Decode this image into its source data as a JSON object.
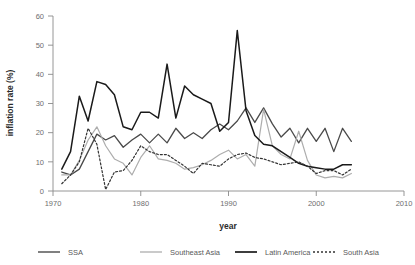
{
  "chart_data": {
    "type": "line",
    "title": "",
    "xlabel": "year",
    "ylabel": "inflation rate (%)",
    "xlim": [
      1970,
      2010
    ],
    "ylim": [
      0,
      60
    ],
    "xticks": [
      1970,
      1980,
      1990,
      2000,
      2010
    ],
    "yticks": [
      0,
      10,
      20,
      30,
      40,
      50,
      60
    ],
    "grid": false,
    "legend_position": "bottom",
    "x": [
      1971,
      1972,
      1973,
      1974,
      1975,
      1976,
      1977,
      1978,
      1979,
      1980,
      1981,
      1982,
      1983,
      1984,
      1985,
      1986,
      1987,
      1988,
      1989,
      1990,
      1991,
      1992,
      1993,
      1994,
      1995,
      1996,
      1997,
      1998,
      1999,
      2000,
      2001,
      2002,
      2003,
      2004
    ],
    "series": [
      {
        "name": "SSA",
        "color": "#4a4a4a",
        "width": 1.3,
        "dash": "none",
        "values": [
          6.5,
          5.5,
          7.5,
          13.5,
          19.5,
          17.5,
          19.0,
          15.0,
          17.5,
          19.5,
          16.5,
          19.5,
          16.5,
          21.5,
          18.0,
          20.0,
          18.0,
          21.0,
          23.0,
          21.0,
          24.0,
          28.5,
          23.5,
          28.5,
          23.0,
          18.5,
          21.5,
          16.5,
          21.5,
          17.0,
          21.5,
          13.5,
          21.5,
          17.0
        ]
      },
      {
        "name": "Southeast Asia",
        "color": "#adadad",
        "width": 1.2,
        "dash": "none",
        "values": [
          5.5,
          5.5,
          10.5,
          17.5,
          22.0,
          15.5,
          11.0,
          9.5,
          5.5,
          11.5,
          15.5,
          11.0,
          10.5,
          9.5,
          7.5,
          8.0,
          9.0,
          10.5,
          12.5,
          14.0,
          11.0,
          12.5,
          8.5,
          28.0,
          15.5,
          12.5,
          11.0,
          20.5,
          10.5,
          5.5,
          4.5,
          5.0,
          4.5,
          6.0
        ]
      },
      {
        "name": "Latin America",
        "color": "#1a1a1a",
        "width": 1.5,
        "dash": "none",
        "values": [
          7.5,
          13.5,
          32.5,
          24.0,
          37.5,
          36.5,
          33.0,
          22.0,
          21.0,
          27.0,
          27.0,
          25.0,
          43.5,
          25.0,
          36.0,
          33.0,
          31.5,
          30.0,
          20.5,
          23.5,
          55.0,
          27.5,
          19.0,
          16.0,
          15.5,
          13.5,
          11.5,
          9.5,
          8.5,
          8.0,
          7.5,
          7.5,
          9.0,
          9.0
        ]
      },
      {
        "name": "South Asia",
        "color": "#333333",
        "width": 1.2,
        "dash": "2,2",
        "values": [
          2.5,
          5.5,
          10.0,
          21.5,
          16.0,
          0.5,
          6.5,
          7.0,
          10.5,
          15.5,
          13.5,
          12.5,
          12.5,
          10.5,
          8.5,
          6.0,
          9.5,
          9.0,
          8.5,
          11.0,
          12.5,
          13.0,
          11.5,
          11.0,
          10.0,
          9.0,
          9.5,
          10.0,
          8.5,
          6.0,
          7.0,
          7.0,
          5.5,
          7.5
        ]
      }
    ],
    "legend": [
      {
        "label": "SSA",
        "color": "#4a4a4a",
        "dash": "none",
        "width": 1.4
      },
      {
        "label": "Southeast Asia",
        "color": "#adadad",
        "dash": "none",
        "width": 1.3
      },
      {
        "label": "Latin America",
        "color": "#1a1a1a",
        "dash": "none",
        "width": 1.7
      },
      {
        "label": "South Asia",
        "color": "#333333",
        "dash": "2,2",
        "width": 1.3
      }
    ]
  }
}
